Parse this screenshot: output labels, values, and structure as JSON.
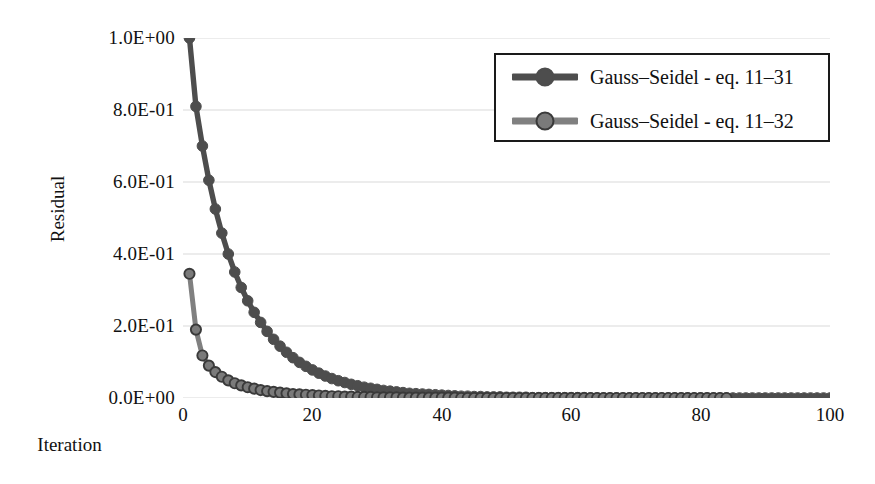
{
  "chart_data": {
    "type": "line",
    "title": "",
    "xlabel": "Iteration",
    "ylabel": "Residual",
    "xlim": [
      0,
      100
    ],
    "ylim": [
      0,
      1
    ],
    "xticks": [
      "0",
      "20",
      "40",
      "60",
      "80",
      "100"
    ],
    "xtick_values": [
      0,
      20,
      40,
      60,
      80,
      100
    ],
    "yticks": [
      "0.0E+00",
      "2.0E-01",
      "4.0E-01",
      "6.0E-01",
      "8.0E-01",
      "1.0E+00"
    ],
    "ytick_values": [
      0,
      0.2,
      0.4,
      0.6,
      0.8,
      1.0
    ],
    "grid": "horizontal",
    "legend_position": "top-right",
    "series": [
      {
        "name": "Gauss–Seidel - eq. 11–31",
        "color": "#4d4d4d",
        "marker": "filled-circle",
        "marker_color": "#4d4d4d",
        "x": [
          1,
          2,
          3,
          4,
          5,
          6,
          7,
          8,
          9,
          10,
          11,
          12,
          13,
          14,
          15,
          16,
          17,
          18,
          19,
          20,
          21,
          22,
          23,
          24,
          25,
          26,
          27,
          28,
          29,
          30,
          31,
          32,
          33,
          34,
          35,
          36,
          37,
          38,
          39,
          40,
          41,
          42,
          43,
          44,
          45,
          46,
          47,
          48,
          49,
          50,
          51,
          52,
          53,
          54,
          55,
          56,
          57,
          58,
          59,
          60,
          61,
          62,
          63,
          64,
          65,
          66,
          67,
          68,
          69,
          70,
          71,
          72,
          73,
          74,
          75,
          76,
          77,
          78,
          79,
          80,
          81,
          82,
          83,
          84,
          85,
          86,
          87,
          88,
          89,
          90,
          91,
          92,
          93,
          94,
          95,
          96,
          97,
          98,
          99,
          100
        ],
        "y": [
          1.0,
          0.81,
          0.7,
          0.605,
          0.525,
          0.458,
          0.4,
          0.35,
          0.307,
          0.27,
          0.238,
          0.21,
          0.185,
          0.163,
          0.144,
          0.127,
          0.112,
          0.099,
          0.088,
          0.078,
          0.069,
          0.061,
          0.054,
          0.048,
          0.043,
          0.038,
          0.034,
          0.03,
          0.027,
          0.024,
          0.021,
          0.019,
          0.017,
          0.015,
          0.013,
          0.012,
          0.011,
          0.01,
          0.009,
          0.008,
          0.007,
          0.006,
          0.005,
          0.005,
          0.004,
          0.004,
          0.003,
          0.003,
          0.003,
          0.002,
          0.002,
          0.002,
          0.002,
          0.001,
          0.001,
          0.001,
          0.001,
          0.001,
          0.001,
          0.001,
          0.001,
          0.001,
          0.0,
          0.0,
          0.0,
          0.0,
          0.0,
          0.0,
          0.0,
          0.0,
          0.0,
          0.0,
          0.0,
          0.0,
          0.0,
          0.0,
          0.0,
          0.0,
          0.0,
          0.0,
          0.0,
          0.0,
          0.0,
          0.0,
          0.0,
          0.0,
          0.0,
          0.0,
          0.0,
          0.0,
          0.0,
          0.0,
          0.0,
          0.0,
          0.0,
          0.0,
          0.0,
          0.0,
          0.0,
          0.0
        ]
      },
      {
        "name": "Gauss–Seidel - eq. 11–32",
        "color": "#808080",
        "marker": "outlined-circle",
        "marker_color": "#7a7a7a",
        "marker_edge_color": "#3a3a3a",
        "x": [
          1,
          2,
          3,
          4,
          5,
          6,
          7,
          8,
          9,
          10,
          11,
          12,
          13,
          14,
          15,
          16,
          17,
          18,
          19,
          20,
          21,
          22,
          23,
          24,
          25,
          26,
          27,
          28,
          29,
          30,
          31,
          32,
          33,
          34,
          35,
          36,
          37,
          38,
          39,
          40,
          41,
          42,
          43,
          44,
          45,
          46,
          47,
          48,
          49,
          50,
          51,
          52,
          53,
          54,
          55,
          56,
          57,
          58,
          59,
          60,
          61,
          62,
          63,
          64,
          65,
          66,
          67,
          68,
          69,
          70,
          71,
          72,
          73,
          74,
          75,
          76,
          77,
          78,
          79,
          80,
          81,
          82,
          83,
          84
        ],
        "y": [
          0.345,
          0.19,
          0.118,
          0.09,
          0.072,
          0.059,
          0.049,
          0.041,
          0.035,
          0.03,
          0.026,
          0.022,
          0.019,
          0.017,
          0.015,
          0.013,
          0.011,
          0.01,
          0.009,
          0.008,
          0.007,
          0.006,
          0.005,
          0.005,
          0.004,
          0.004,
          0.003,
          0.003,
          0.003,
          0.002,
          0.002,
          0.002,
          0.002,
          0.001,
          0.001,
          0.001,
          0.001,
          0.001,
          0.001,
          0.001,
          0.001,
          0.001,
          0.0,
          0.0,
          0.0,
          0.0,
          0.0,
          0.0,
          0.0,
          0.0,
          0.0,
          0.0,
          0.0,
          0.0,
          0.0,
          0.0,
          0.0,
          0.0,
          0.0,
          0.0,
          0.0,
          0.0,
          0.0,
          0.0,
          0.0,
          0.0,
          0.0,
          0.0,
          0.0,
          0.0,
          0.0,
          0.0,
          0.0,
          0.0,
          0.0,
          0.0,
          0.0,
          0.0,
          0.0,
          0.0,
          0.0,
          0.0,
          0.0,
          0.0
        ]
      }
    ]
  },
  "style": {
    "grid_color": "#d9d9d9",
    "legend_border_color": "#1a1a1a",
    "text_color": "#111111",
    "background": "#ffffff"
  }
}
